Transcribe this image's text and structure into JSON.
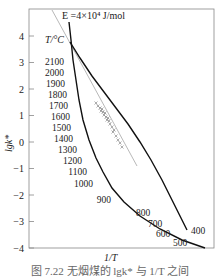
{
  "chart_data": {
    "type": "line",
    "title": "",
    "xlabel": "1/T",
    "ylabel": "lgk*",
    "ylim": [
      -4,
      4.5
    ],
    "yticks": [
      4,
      3,
      2,
      1,
      0,
      -1,
      -2,
      -3,
      -4
    ],
    "grid": false,
    "legend": "none",
    "annotations": {
      "activation_energy": "E =4×10⁴ J/mol",
      "temp_unit": "T/°C"
    },
    "temperature_scale_labels": [
      "2100",
      "2000",
      "1900",
      "1800",
      "1700",
      "1600",
      "1500",
      "1400",
      "1300",
      "1200",
      "1100",
      "1000",
      "900",
      "800",
      "700",
      "600",
      "500",
      "400"
    ],
    "series": [
      {
        "name": "temperature-scale curve",
        "points": [
          [
            69,
            22
          ],
          [
            71,
            40
          ],
          [
            73,
            60
          ],
          [
            76,
            80
          ],
          [
            79,
            100
          ],
          [
            83,
            120
          ],
          [
            89,
            140
          ],
          [
            96,
            158
          ],
          [
            103,
            172
          ],
          [
            112,
            188
          ],
          [
            124,
            202
          ],
          [
            140,
            216
          ],
          [
            160,
            229
          ],
          [
            182,
            240
          ],
          [
            205,
            248
          ]
        ]
      },
      {
        "name": "experimental curve",
        "points": [
          [
            70,
            42
          ],
          [
            80,
            58
          ],
          [
            92,
            76
          ],
          [
            104,
            92
          ],
          [
            116,
            108
          ],
          [
            128,
            124
          ],
          [
            140,
            142
          ],
          [
            151,
            160
          ],
          [
            162,
            180
          ],
          [
            172,
            200
          ],
          [
            181,
            218
          ],
          [
            187,
            230
          ]
        ]
      },
      {
        "name": "E = 4×10^4 J/mol reference line",
        "points": [
          [
            52,
            10
          ],
          [
            137,
            166
          ]
        ]
      }
    ],
    "scatter_points": [
      [
        96,
        103
      ],
      [
        98,
        106
      ],
      [
        100,
        108
      ],
      [
        101,
        111
      ],
      [
        103,
        112
      ],
      [
        104,
        115
      ],
      [
        106,
        117
      ],
      [
        107,
        120
      ],
      [
        109,
        121
      ],
      [
        110,
        124
      ],
      [
        112,
        127
      ],
      [
        114,
        130
      ],
      [
        116,
        136
      ],
      [
        118,
        140
      ],
      [
        120,
        143
      ],
      [
        122,
        147
      ],
      [
        102,
        109
      ],
      [
        105,
        113
      ],
      [
        108,
        118
      ],
      [
        113,
        132
      ]
    ]
  },
  "caption": "图 7.22  无烟煤的 lgk* 与 1/T 之间"
}
